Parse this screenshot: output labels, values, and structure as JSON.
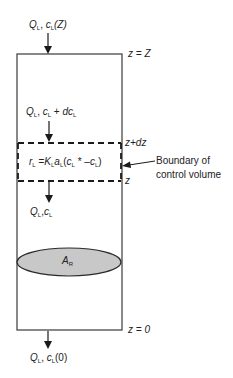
{
  "diagram": {
    "inlet_label": {
      "Q": "Q",
      "Q_sub": "L",
      "sep": ", ",
      "c": "c",
      "c_sub": "L",
      "arg": "(Z)"
    },
    "top_level_label": "z = Z",
    "upper_flow_label": {
      "Q": "Q",
      "Q_sub": "L",
      "sep": ", ",
      "c": "c",
      "c_sub": "L",
      "plus": " + ",
      "dc": "dc",
      "dc_sub": "L"
    },
    "control_volume_top_label": "z+dz",
    "control_volume_bottom_label": "z",
    "rate_equation": {
      "r": "r",
      "r_sub": "L",
      "eq": " =",
      "K": "K",
      "K_sub": "L",
      "a": "a",
      "a_sub": "L",
      "open": "(",
      "c1": "c",
      "c1_sub": "L",
      "star": " *",
      "minus": " –",
      "c2": "c",
      "c2_sub": "L",
      "close": ")"
    },
    "boundary_annotation": {
      "line1": "Boundary of",
      "line2": "control volume"
    },
    "lower_flow_label": {
      "Q": "Q",
      "Q_sub": "L",
      "sep": ",",
      "c": "c",
      "c_sub": "L"
    },
    "ellipse_label": {
      "A": "A",
      "A_sub": "R"
    },
    "bottom_level_label": "z = 0",
    "outlet_label": {
      "Q": "Q",
      "Q_sub": "L",
      "sep": ", ",
      "c": "c",
      "c_sub": "L",
      "arg": "(0)"
    },
    "colors": {
      "line": "#3a3a3a",
      "ellipse_fill": "#c8c8c8",
      "ellipse_stroke": "#2a2a2a"
    }
  }
}
